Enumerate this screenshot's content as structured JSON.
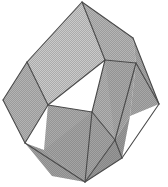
{
  "figure": {
    "kind": "line-drawing",
    "caption": "",
    "background_color": "#ffffff",
    "edge_color": "#4a4a4a",
    "edge_width": 1.1,
    "texture": "halftone-dot-screen",
    "canvas": {
      "width": 168,
      "height": 187
    },
    "palette": {
      "face_lightest": "#e6e6e6",
      "face_light": "#d9d9d9",
      "face_mid_light": "#cfcfcf",
      "face_mid": "#c2c2c2",
      "face_mid_dark": "#b5b5b5",
      "face_dark": "#a8a8a8",
      "face_darkest": "#9c9c9c"
    },
    "vertices": {
      "top_apex": [
        82,
        2
      ],
      "upper_right_ridge": [
        133,
        38
      ],
      "right_extreme": [
        159,
        104
      ],
      "lower_right": [
        122,
        158
      ],
      "bottom_apex": [
        85,
        182
      ],
      "lower_left": [
        25,
        143
      ],
      "left_extreme": [
        3,
        100
      ],
      "upper_left_ridge": [
        27,
        62
      ],
      "center_upper": [
        105,
        60
      ],
      "center_left": [
        48,
        105
      ],
      "center_lower": [
        115,
        140
      ],
      "center_core": [
        92,
        112
      ]
    },
    "faces": [
      {
        "name": "top-left-rhombus",
        "points": "82,2 105,60 48,105 27,62",
        "fill": "#e3e3e3"
      },
      {
        "name": "top-right-rhombus",
        "points": "82,2 133,38 136,63 105,60",
        "fill": "#c9c9c9"
      },
      {
        "name": "right-upper-rhombus",
        "points": "133,38 159,104 130,116 136,63",
        "fill": "#b8b8b8"
      },
      {
        "name": "center-front-rhombus",
        "points": "105,60 136,63 115,140 92,112",
        "fill": "#c4c4c4"
      },
      {
        "name": "center-left-front-rhombus",
        "points": "48,105 92,112 85,182 44,150",
        "fill": "#bdbdbd"
      },
      {
        "name": "left-rhombus",
        "points": "27,62 48,105 25,143 3,100",
        "fill": "#c7c7c7"
      },
      {
        "name": "bottom-left-rhombus",
        "points": "25,143 44,150 85,182 52,176",
        "fill": "#b0b0b0"
      },
      {
        "name": "bottom-right-rhombus",
        "points": "85,182 115,140 130,116 122,158",
        "fill": "#a6a6a6"
      },
      {
        "name": "center-core-rhombus",
        "points": "92,112 115,140 85,182 44,150",
        "fill": "#b4b4b4"
      },
      {
        "name": "right-lower-sliver",
        "points": "136,63 130,116 115,140 105,60",
        "fill": "#bbbbbb"
      }
    ],
    "edges": [
      {
        "name": "edge-top-to-upper-right",
        "from": [
          82,
          2
        ],
        "to": [
          133,
          38
        ]
      },
      {
        "name": "edge-upper-right-to-right",
        "from": [
          133,
          38
        ],
        "to": [
          159,
          104
        ]
      },
      {
        "name": "edge-right-to-lower-right",
        "from": [
          159,
          104
        ],
        "to": [
          122,
          158
        ]
      },
      {
        "name": "edge-lower-right-to-bottom",
        "from": [
          122,
          158
        ],
        "to": [
          85,
          182
        ]
      },
      {
        "name": "edge-bottom-to-lower-left",
        "from": [
          85,
          182
        ],
        "to": [
          25,
          143
        ]
      },
      {
        "name": "edge-lower-left-to-left",
        "from": [
          25,
          143
        ],
        "to": [
          3,
          100
        ]
      },
      {
        "name": "edge-left-to-upper-left",
        "from": [
          3,
          100
        ],
        "to": [
          27,
          62
        ]
      },
      {
        "name": "edge-upper-left-to-top",
        "from": [
          27,
          62
        ],
        "to": [
          82,
          2
        ]
      },
      {
        "name": "edge-top-to-center-upper",
        "from": [
          82,
          2
        ],
        "to": [
          105,
          60
        ]
      },
      {
        "name": "edge-upper-left-to-center-left",
        "from": [
          27,
          62
        ],
        "to": [
          48,
          105
        ]
      },
      {
        "name": "edge-center-upper-to-center-left",
        "from": [
          105,
          60
        ],
        "to": [
          48,
          105
        ]
      },
      {
        "name": "edge-center-left-to-lower-left",
        "from": [
          48,
          105
        ],
        "to": [
          25,
          143
        ]
      },
      {
        "name": "edge-center-upper-to-right-mid",
        "from": [
          105,
          60
        ],
        "to": [
          136,
          63
        ]
      },
      {
        "name": "edge-right-mid-to-right-extreme",
        "from": [
          136,
          63
        ],
        "to": [
          159,
          104
        ]
      },
      {
        "name": "edge-right-mid-to-center-lower",
        "from": [
          136,
          63
        ],
        "to": [
          115,
          140
        ]
      },
      {
        "name": "edge-center-lower-to-lower-right",
        "from": [
          115,
          140
        ],
        "to": [
          122,
          158
        ]
      },
      {
        "name": "edge-center-lower-to-bottom",
        "from": [
          115,
          140
        ],
        "to": [
          85,
          182
        ]
      },
      {
        "name": "edge-center-left-to-core",
        "from": [
          48,
          105
        ],
        "to": [
          92,
          112
        ]
      },
      {
        "name": "edge-core-to-center-lower",
        "from": [
          92,
          112
        ],
        "to": [
          115,
          140
        ]
      },
      {
        "name": "edge-core-to-bottom",
        "from": [
          92,
          112
        ],
        "to": [
          85,
          182
        ]
      },
      {
        "name": "edge-center-upper-to-core",
        "from": [
          105,
          60
        ],
        "to": [
          92,
          112
        ]
      }
    ]
  }
}
